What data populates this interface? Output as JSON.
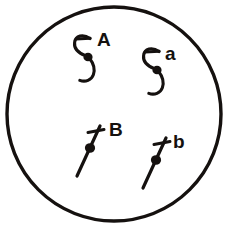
{
  "figure": {
    "background_color": "#ffffff",
    "ink_color": "#15110f",
    "canvas": {
      "width": 226,
      "height": 228
    }
  },
  "boundary": {
    "name": "outer-circle",
    "shape": "circle",
    "center_x": 114,
    "center_y": 114,
    "radius": 107,
    "stroke_width": 3.4,
    "label": ""
  },
  "markers": [
    {
      "id": "marker-A",
      "label": "A",
      "glyph": "hooked-s-curve-with-dot",
      "glyph_description": "upper hook curving left with a short horizontal bar, filled dot at centre, lower hook curving right then left",
      "center_x": 88,
      "center_y": 57,
      "label_x": 97,
      "label_y": 46,
      "label_size": 19
    },
    {
      "id": "marker-a",
      "label": "a",
      "glyph": "hooked-s-curve-with-dot",
      "glyph_description": "upper hook curving left with a short horizontal bar, filled dot at centre, lower hook curving right then left",
      "center_x": 157,
      "center_y": 70,
      "label_x": 165,
      "label_y": 60,
      "label_size": 19
    },
    {
      "id": "marker-B",
      "label": "B",
      "glyph": "diagonal-line-with-cross-stroke-and-dot",
      "glyph_description": "diagonal rod from lower-left to upper-right, short cross stroke near the top, filled dot at the midpoint",
      "center_x": 90,
      "center_y": 148,
      "label_x": 109,
      "label_y": 136,
      "label_size": 19
    },
    {
      "id": "marker-b",
      "label": "b",
      "glyph": "diagonal-line-with-cross-stroke-and-dot",
      "glyph_description": "diagonal rod from lower-left to upper-right, short cross stroke near the top, filled dot at the midpoint",
      "center_x": 156,
      "center_y": 160,
      "label_x": 173,
      "label_y": 148,
      "label_size": 19
    }
  ]
}
